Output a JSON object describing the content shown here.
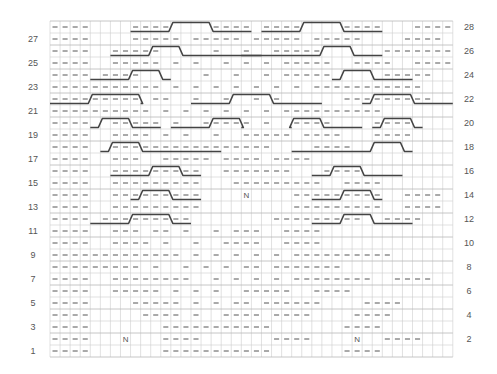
{
  "chart_data": {
    "type": "knitting-chart",
    "title": "",
    "columns": 40,
    "rows": 28,
    "legend": {
      "-": "purl",
      ".": "knit",
      "N": "no stitch"
    },
    "row_labels_left": [
      1,
      3,
      5,
      7,
      9,
      11,
      13,
      15,
      17,
      19,
      21,
      23,
      25,
      27
    ],
    "row_labels_right": [
      2,
      4,
      6,
      8,
      10,
      12,
      14,
      16,
      18,
      20,
      22,
      24,
      26,
      28
    ],
    "grid_rows_top_to_bottom": [
      "----....----....----.----....----...----",
      "----....-----.-----.-----.-----....----",
      "----..-----.....-..-..-----......---------",
      "----..-----.-.-..-.-.-.-----..----..----",
      "----.----......-..-..-.-----.....-----",
      "-----------.-.-.-.-.-.-.-.-----------",
      "---------.--..-..-..-.-......---------",
      "----------.-.-.-.-.-.-.----------",
      "----..-----.-..-----.-..----....----",
      "----..----.-.-..-..-----.----...----",
      "----..----------------....----",
      "----..---..-----.----.----",
      "----..---------..-------...----",
      "----..---------...---------..----",
      "----..---------....N....---------..----",
      "----..---------.........---------..----",
      "----.---------........---------..----",
      "----..---.--.-..-.---..----",
      "----..----.-..-..----..----",
      "-------------.-.-.-.-.-.----------",
      "---------.-..-.-.-.--.-------",
      "----..--------..-.-.-.-.--------..----",
      "----..-----.-.-.-..-----..----",
      "----....-----.-.-.--.------....----",
      "----.....----.-..----.----....----",
      "----.......-----------.......----",
      "----...N...----.......----....N..----",
      "----.......-----------.......----"
    ],
    "cables": [
      {
        "row": 28,
        "cols": [
          8,
          19
        ],
        "cross": [
          12,
          15
        ]
      },
      {
        "row": 28,
        "cols": [
          21,
          32
        ],
        "cross": [
          25,
          28
        ]
      },
      {
        "row": 26,
        "cols": [
          6,
          20
        ],
        "cross": [
          10,
          12
        ]
      },
      {
        "row": 26,
        "cols": [
          19,
          32
        ],
        "cross": [
          27,
          29
        ]
      },
      {
        "row": 24,
        "cols": [
          4,
          11
        ],
        "cross": [
          8,
          10
        ]
      },
      {
        "row": 24,
        "cols": [
          28,
          35
        ],
        "cross": [
          29,
          31
        ]
      },
      {
        "row": 22,
        "cols": [
          0,
          8
        ],
        "cross": [
          4,
          8
        ]
      },
      {
        "row": 22,
        "cols": [
          14,
          26
        ],
        "cross": [
          18,
          21
        ]
      },
      {
        "row": 22,
        "cols": [
          31,
          39
        ],
        "cross": [
          32,
          35
        ]
      },
      {
        "row": 20,
        "cols": [
          4,
          10
        ],
        "cross": [
          5,
          7
        ]
      },
      {
        "row": 20,
        "cols": [
          12,
          18
        ],
        "cross": [
          16,
          18
        ]
      },
      {
        "row": 20,
        "cols": [
          24,
          30
        ],
        "cross": [
          24,
          26
        ]
      },
      {
        "row": 20,
        "cols": [
          32,
          36
        ],
        "cross": [
          33,
          35
        ]
      },
      {
        "row": 18,
        "cols": [
          5,
          16
        ],
        "cross": [
          6,
          8
        ]
      },
      {
        "row": 18,
        "cols": [
          24,
          35
        ],
        "cross": [
          32,
          34
        ]
      },
      {
        "row": 16,
        "cols": [
          6,
          14
        ],
        "cross": [
          10,
          12
        ]
      },
      {
        "row": 16,
        "cols": [
          26,
          34
        ],
        "cross": [
          28,
          30
        ]
      },
      {
        "row": 14,
        "cols": [
          8,
          14
        ],
        "cross": [
          9,
          11
        ]
      },
      {
        "row": 14,
        "cols": [
          26,
          32
        ],
        "cross": [
          29,
          31
        ]
      },
      {
        "row": 12,
        "cols": [
          4,
          13
        ],
        "cross": [
          8,
          11
        ]
      },
      {
        "row": 12,
        "cols": [
          26,
          35
        ],
        "cross": [
          29,
          31
        ]
      }
    ]
  },
  "row_labels": {
    "left": [
      "27",
      "25",
      "23",
      "21",
      "19",
      "17",
      "15",
      "13",
      "11",
      "9",
      "7",
      "5",
      "3",
      "1"
    ],
    "right": [
      "28",
      "26",
      "24",
      "22",
      "20",
      "18",
      "16",
      "14",
      "12",
      "10",
      "8",
      "6",
      "4",
      "2"
    ]
  },
  "markers": {
    "n_label": "N"
  }
}
